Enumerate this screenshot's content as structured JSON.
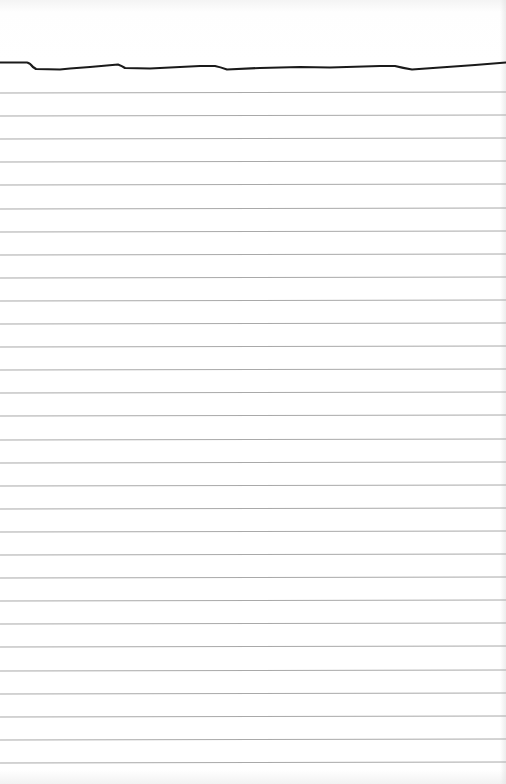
{
  "page": {
    "type": "lined-notepad-page",
    "colors": {
      "paper": "#ffffff",
      "rule_line": "#a9a9a9",
      "header_line": "#1a1a1a"
    },
    "rule_count": 30,
    "first_rule_y": 92,
    "rule_spacing": 23.1,
    "text_content": []
  }
}
